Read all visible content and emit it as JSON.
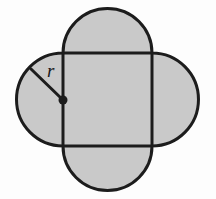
{
  "figure": {
    "name": "square-with-four-semicircles",
    "background_color": "#fdfdfd",
    "fill_color": "#c9c9c9",
    "stroke_color": "#1c1c1c",
    "stroke_width": 3,
    "labels": {
      "radius": "r"
    },
    "radius_label": {
      "text": "r",
      "x": 47,
      "y": 77
    },
    "square": {
      "left": 63,
      "top": 53,
      "right": 152,
      "bottom": 146,
      "width": 89,
      "height": 93
    },
    "semicircles": [
      {
        "side": "top",
        "radius": 44,
        "center_x": 107.5,
        "center_y": 53
      },
      {
        "side": "right",
        "radius": 44,
        "center_x": 152,
        "center_y": 99.5
      },
      {
        "side": "bottom",
        "radius": 42,
        "center_x": 107.5,
        "center_y": 146
      },
      {
        "side": "left",
        "radius": 45,
        "center_x": 63,
        "center_y": 99.5
      }
    ],
    "radius_line": {
      "from_x": 63,
      "from_y": 100,
      "to_x": 31,
      "to_y": 69
    },
    "center_dot": {
      "x": 63,
      "y": 100,
      "r": 4.5
    },
    "outline_path": "M 63 53 A 44 44 0 0 1 152 53 A 44 44 0 0 1 152 146 A 42 42 0 0 1 63 146 A 45 45 0 0 1 63 53 Z"
  }
}
